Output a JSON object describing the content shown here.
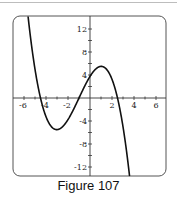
{
  "caption": "Figure 107",
  "chart_data": {
    "type": "line",
    "title": "",
    "caption": "Figure 107",
    "xlabel": "",
    "ylabel": "",
    "xlim": [
      -7,
      7
    ],
    "ylim": [
      -14,
      14
    ],
    "grid": false,
    "x_ticks": [
      -6,
      -4,
      -2,
      2,
      4,
      6
    ],
    "y_ticks": [
      12,
      8,
      4,
      -4,
      -8,
      -12
    ],
    "x_minor_step": 1,
    "y_minor_step": 2,
    "series": [
      {
        "name": "f(x)",
        "description": "Cubic with roots near x=-4.5, -1, 2.5; local min near (-3, -5.4); local max near (1, 5.4); y-intercept about 3.75",
        "formula": "-(1/3)(x+4.5)(x+1)(x-2.5)",
        "x": [
          -5.6,
          -5,
          -4.5,
          -4,
          -3.5,
          -3,
          -2.5,
          -2,
          -1.5,
          -1,
          -0.5,
          0,
          0.5,
          1,
          1.5,
          2,
          2.5,
          3,
          3.5,
          3.6
        ],
        "y": [
          14.2,
          7.3,
          0,
          -1.5,
          -4.3,
          -5.4,
          -5.0,
          -3.9,
          -2.2,
          0,
          1.4,
          3.75,
          4.95,
          5.4,
          5.0,
          3.75,
          0,
          -3.0,
          -6.8,
          -13.7
        ]
      }
    ]
  },
  "colors": {
    "frame": "#555555",
    "axis": "#333333",
    "curve": "#111111"
  }
}
